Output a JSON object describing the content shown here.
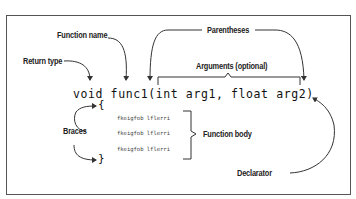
{
  "diagram": {
    "labels": {
      "function_name": "Function name",
      "return_type": "Return type",
      "parentheses": "Parentheses",
      "arguments": "Arguments (optional)",
      "braces": "Braces",
      "function_body": "Function body",
      "declarator": "Declarator"
    },
    "code": {
      "declaration": "void func1(int arg1, float arg2)",
      "open_brace": "{",
      "close_brace": "}",
      "body_lines": [
        "fkeigfob lflerri",
        "fkeigfob lflerri",
        "fkeigfob lflerri"
      ]
    },
    "colors": {
      "stroke": "#333333",
      "frame": "#555555",
      "text": "#222222"
    }
  }
}
